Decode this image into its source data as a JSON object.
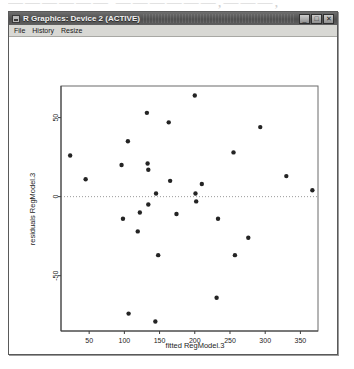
{
  "page_bleed_text": "——————  ——————,———,",
  "window": {
    "title": "R Graphics: Device 2 (ACTIVE)",
    "icon": "r-graphics-icon",
    "buttons": [
      {
        "name": "minimize",
        "glyph": "_"
      },
      {
        "name": "maximize",
        "glyph": "□"
      },
      {
        "name": "close",
        "glyph": "✕"
      }
    ]
  },
  "menubar": {
    "items": [
      {
        "label": "File",
        "name": "menu-file"
      },
      {
        "label": "History",
        "name": "menu-history"
      },
      {
        "label": "Resize",
        "name": "menu-resize"
      }
    ]
  },
  "chart_data": {
    "type": "scatter",
    "title": "",
    "xlabel": "fitted RegModel.3",
    "ylabel": "residuals RegModel.3",
    "xlim": [
      10,
      375
    ],
    "ylim": [
      -85,
      70
    ],
    "xticks": [
      50,
      100,
      150,
      200,
      250,
      300,
      350
    ],
    "yticks": [
      50,
      0,
      -50
    ],
    "grid": false,
    "legend": null,
    "reference_line": {
      "orientation": "horizontal",
      "y": 0,
      "style": "dotted"
    },
    "points": [
      {
        "x": 23,
        "y": 26
      },
      {
        "x": 45,
        "y": 11
      },
      {
        "x": 96,
        "y": 20
      },
      {
        "x": 98,
        "y": -14
      },
      {
        "x": 105,
        "y": 35
      },
      {
        "x": 106,
        "y": -74
      },
      {
        "x": 119,
        "y": -22
      },
      {
        "x": 122,
        "y": -10
      },
      {
        "x": 132,
        "y": 53
      },
      {
        "x": 133,
        "y": 21
      },
      {
        "x": 134,
        "y": 17
      },
      {
        "x": 134,
        "y": -5
      },
      {
        "x": 144,
        "y": -79
      },
      {
        "x": 145,
        "y": 2
      },
      {
        "x": 148,
        "y": -37
      },
      {
        "x": 163,
        "y": 47
      },
      {
        "x": 165,
        "y": 10
      },
      {
        "x": 174,
        "y": -11
      },
      {
        "x": 200,
        "y": 64
      },
      {
        "x": 201,
        "y": 2
      },
      {
        "x": 202,
        "y": -3
      },
      {
        "x": 210,
        "y": 8
      },
      {
        "x": 231,
        "y": -64
      },
      {
        "x": 233,
        "y": -14
      },
      {
        "x": 255,
        "y": 28
      },
      {
        "x": 257,
        "y": -37
      },
      {
        "x": 276,
        "y": -26
      },
      {
        "x": 293,
        "y": 44
      },
      {
        "x": 330,
        "y": 13
      },
      {
        "x": 367,
        "y": 4
      }
    ]
  }
}
